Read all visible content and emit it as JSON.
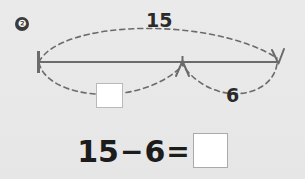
{
  "worksheet": {
    "problem_number": "❷",
    "background_color": "#e8e8e8"
  },
  "diagram": {
    "type": "number-bond-bar-model",
    "total_label": "15",
    "known_part_label": "6",
    "unknown_part_label": "",
    "line_color": "#6b6b6b",
    "arc_color": "#6b6b6b",
    "start_tick_name": "start-tick",
    "mid_arrow_name": "middle-arrowhead",
    "end_arrow_name": "end-arrowhead"
  },
  "equation": {
    "left_operand": "15",
    "operator": "−",
    "right_operand": "6",
    "equals": "=",
    "answer": ""
  }
}
